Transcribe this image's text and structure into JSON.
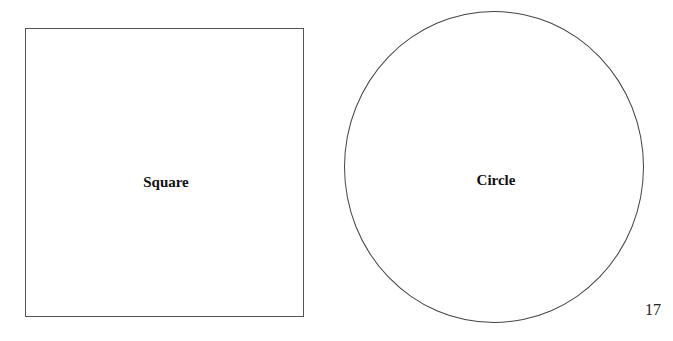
{
  "shapes": {
    "square": {
      "label": "Square"
    },
    "circle": {
      "label": "Circle"
    }
  },
  "page_number": "17"
}
